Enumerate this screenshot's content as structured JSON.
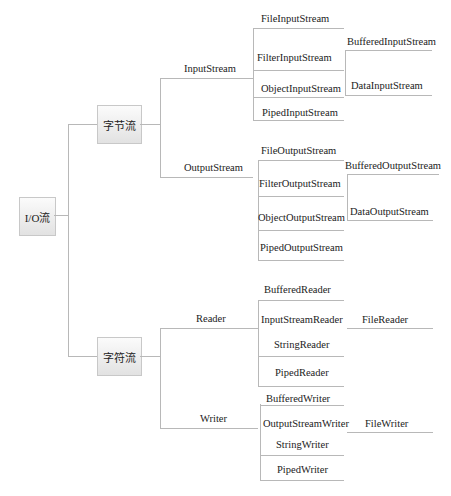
{
  "header_partial_text": "…(cut-off line of Chinese text at top of page)…",
  "root": {
    "label": "I/O流"
  },
  "categories": [
    {
      "label": "字节流",
      "branches": [
        {
          "label": "InputStream",
          "children": [
            {
              "label": "FileInputStream"
            },
            {
              "label": "FilterInputStream",
              "children": [
                {
                  "label": "BufferedInputStream"
                },
                {
                  "label": "DataInputStream"
                }
              ]
            },
            {
              "label": "ObjectInputStream"
            },
            {
              "label": "PipedInputStream"
            }
          ]
        },
        {
          "label": "OutputStream",
          "children": [
            {
              "label": "FileOutputStream"
            },
            {
              "label": "FilterOutputStream",
              "children": [
                {
                  "label": "BufferedOutputStream"
                },
                {
                  "label": "DataOutputStream"
                }
              ]
            },
            {
              "label": "ObjectOutputStream"
            },
            {
              "label": "PipedOutputStream"
            }
          ]
        }
      ]
    },
    {
      "label": "字符流",
      "branches": [
        {
          "label": "Reader",
          "children": [
            {
              "label": "BufferedReader"
            },
            {
              "label": "InputStreamReader",
              "children": [
                {
                  "label": "FileReader"
                }
              ]
            },
            {
              "label": "StringReader"
            },
            {
              "label": "PipedReader"
            }
          ]
        },
        {
          "label": "Writer",
          "children": [
            {
              "label": "BufferedWriter"
            },
            {
              "label": "OutputStreamWriter",
              "children": [
                {
                  "label": "FileWriter"
                }
              ]
            },
            {
              "label": "StringWriter"
            },
            {
              "label": "PipedWriter"
            }
          ]
        }
      ]
    }
  ],
  "colors": {
    "line": "#b8b8b8",
    "box_border": "#c8c8c8",
    "box_top": "#fbfbfb",
    "box_bottom": "#e2e2e2",
    "text": "#222222"
  }
}
